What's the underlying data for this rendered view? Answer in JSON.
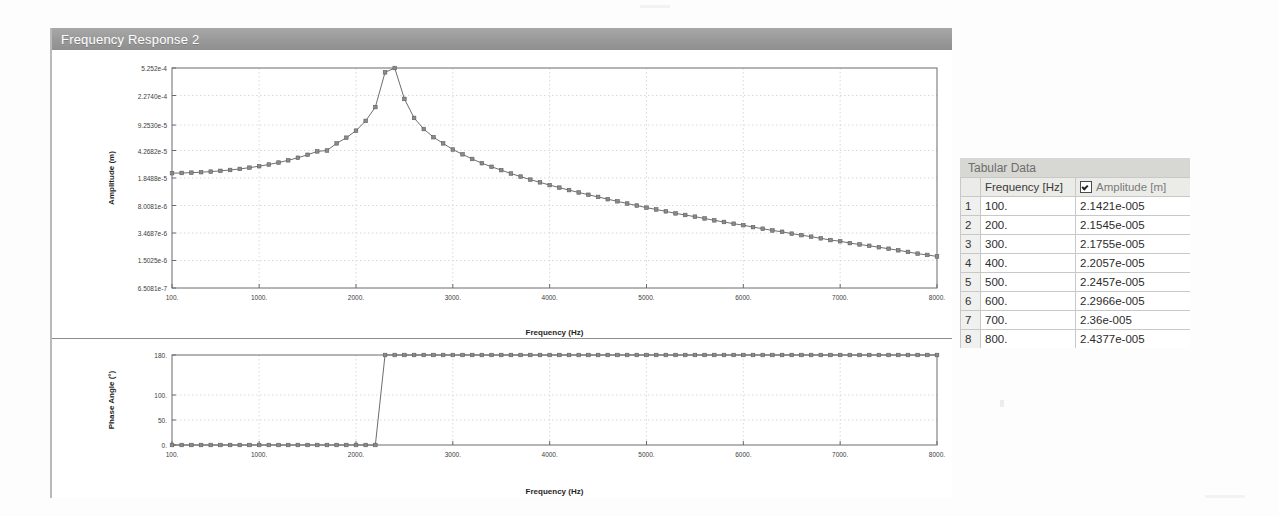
{
  "window": {
    "title": "Frequency Response 2"
  },
  "amplitude_plot": {
    "ylabel": "Amplitude (m)",
    "xlabel": "Frequency (Hz)",
    "ytick_labels": [
      "5.252e-4",
      "2.2740e-4",
      "9.2530e-5",
      "4.2682e-5",
      "1.8488e-5",
      "8.0081e-6",
      "3.4687e-6",
      "1.5025e-6",
      "6.5081e-7"
    ],
    "xtick_labels": [
      "100.",
      "1000.",
      "2000.",
      "3000.",
      "4000.",
      "5000.",
      "6000.",
      "7000.",
      "8000."
    ],
    "marker": "square",
    "line_color": "#6e6e6e",
    "grid": true
  },
  "phase_plot": {
    "ylabel": "Phase Angle (°)",
    "xlabel": "Frequency (Hz)",
    "ytick_labels": [
      "180.",
      "100.",
      "50.",
      "0."
    ],
    "xtick_labels": [
      "100.",
      "1000.",
      "2000.",
      "3000.",
      "4000.",
      "5000.",
      "6000.",
      "7000.",
      "8000."
    ],
    "marker": "square",
    "line_color": "#6e6e6e",
    "grid": true
  },
  "tabular_data": {
    "panel_title": "Tabular Data",
    "columns": [
      "",
      "Frequency [Hz]",
      "Amplitude [m]"
    ],
    "amplitude_checked": true,
    "rows": [
      {
        "n": "1",
        "frequency": "100.",
        "amplitude": "2.1421e-005"
      },
      {
        "n": "2",
        "frequency": "200.",
        "amplitude": "2.1545e-005"
      },
      {
        "n": "3",
        "frequency": "300.",
        "amplitude": "2.1755e-005"
      },
      {
        "n": "4",
        "frequency": "400.",
        "amplitude": "2.2057e-005"
      },
      {
        "n": "5",
        "frequency": "500.",
        "amplitude": "2.2457e-005"
      },
      {
        "n": "6",
        "frequency": "600.",
        "amplitude": "2.2966e-005"
      },
      {
        "n": "7",
        "frequency": "700.",
        "amplitude": "2.36e-005"
      },
      {
        "n": "8",
        "frequency": "800.",
        "amplitude": "2.4377e-005"
      }
    ]
  },
  "chart_data": [
    {
      "type": "line",
      "title": "Frequency Response 2 — Amplitude",
      "xlabel": "Frequency (Hz)",
      "ylabel": "Amplitude (m)",
      "yscale": "log",
      "xlim": [
        100,
        8000
      ],
      "ylim": [
        6.5081e-07,
        0.0005252
      ],
      "ytick_values": [
        0.0005252,
        0.0002274,
        9.253e-05,
        4.2682e-05,
        1.8488e-05,
        8.0081e-06,
        3.4687e-06,
        1.5025e-06,
        6.5081e-07
      ],
      "ytick_labels": [
        "5.252e-4",
        "2.2740e-4",
        "9.2530e-5",
        "4.2682e-5",
        "1.8488e-5",
        "8.0081e-6",
        "3.4687e-6",
        "1.5025e-6",
        "6.5081e-7"
      ],
      "xtick_values": [
        100,
        1000,
        2000,
        3000,
        4000,
        5000,
        6000,
        7000,
        8000
      ],
      "xtick_labels": [
        "100.",
        "1000.",
        "2000.",
        "3000.",
        "4000.",
        "5000.",
        "6000.",
        "7000.",
        "8000."
      ],
      "grid": true,
      "legend": "none",
      "series": [
        {
          "name": "Amplitude",
          "x": [
            100,
            200,
            300,
            400,
            500,
            600,
            700,
            800,
            900,
            1000,
            1100,
            1200,
            1300,
            1400,
            1500,
            1600,
            1700,
            1800,
            1900,
            2000,
            2100,
            2200,
            2300,
            2400,
            2500,
            2600,
            2700,
            2800,
            2900,
            3000,
            3100,
            3200,
            3300,
            3400,
            3500,
            3600,
            3700,
            3800,
            3900,
            4000,
            4100,
            4200,
            4300,
            4400,
            4500,
            4600,
            4700,
            4800,
            4900,
            5000,
            5100,
            5200,
            5300,
            5400,
            5500,
            5600,
            5700,
            5800,
            5900,
            6000,
            6100,
            6200,
            6300,
            6400,
            6500,
            6600,
            6700,
            6800,
            6900,
            7000,
            7100,
            7200,
            7300,
            7400,
            7500,
            7600,
            7700,
            7800,
            7900,
            8000
          ],
          "y": [
            2.1421e-05,
            2.1545e-05,
            2.1755e-05,
            2.2057e-05,
            2.2457e-05,
            2.2966e-05,
            2.36e-05,
            2.4377e-05,
            2.5324e-05,
            2.6474e-05,
            2.7871e-05,
            2.9573e-05,
            3.1659e-05,
            3.4238e-05,
            3.7463e-05,
            4.156e-05,
            4.2682e-05,
            5.3e-05,
            6.3e-05,
            7.8e-05,
            0.000105,
            0.00016,
            0.00046,
            0.0005252,
            0.000205,
            0.000115,
            8.2e-05,
            6.4e-05,
            5.3e-05,
            4.4e-05,
            3.8e-05,
            3.3e-05,
            2.9e-05,
            2.6e-05,
            2.35e-05,
            2.12e-05,
            1.93e-05,
            1.76e-05,
            1.62e-05,
            1.49e-05,
            1.38e-05,
            1.28e-05,
            1.19e-05,
            1.11e-05,
            1.04e-05,
            9.7e-06,
            9.1e-06,
            8.5e-06,
            8e-06,
            7.5e-06,
            7.1e-06,
            6.7e-06,
            6.3e-06,
            6e-06,
            5.7e-06,
            5.4e-06,
            5.1e-06,
            4.85e-06,
            4.6e-06,
            4.4e-06,
            4.15e-06,
            3.95e-06,
            3.75e-06,
            3.6e-06,
            3.4e-06,
            3.25e-06,
            3.1e-06,
            2.95e-06,
            2.8e-06,
            2.7e-06,
            2.55e-06,
            2.45e-06,
            2.35e-06,
            2.25e-06,
            2.15e-06,
            2.05e-06,
            1.95e-06,
            1.85e-06,
            1.78e-06,
            1.7e-06
          ]
        }
      ]
    },
    {
      "type": "line",
      "title": "Frequency Response 2 — Phase",
      "xlabel": "Frequency (Hz)",
      "ylabel": "Phase Angle (°)",
      "yscale": "linear",
      "xlim": [
        100,
        8000
      ],
      "ylim": [
        0,
        180
      ],
      "ytick_values": [
        0,
        50,
        100,
        180
      ],
      "ytick_labels": [
        "0.",
        "50.",
        "100.",
        "180."
      ],
      "xtick_values": [
        100,
        1000,
        2000,
        3000,
        4000,
        5000,
        6000,
        7000,
        8000
      ],
      "xtick_labels": [
        "100.",
        "1000.",
        "2000.",
        "3000.",
        "4000.",
        "5000.",
        "6000.",
        "7000.",
        "8000."
      ],
      "grid": true,
      "legend": "none",
      "series": [
        {
          "name": "Phase Angle",
          "x": [
            100,
            200,
            300,
            400,
            500,
            600,
            700,
            800,
            900,
            1000,
            1100,
            1200,
            1300,
            1400,
            1500,
            1600,
            1700,
            1800,
            1900,
            2000,
            2100,
            2200,
            2300,
            2400,
            2500,
            2600,
            2700,
            2800,
            2900,
            3000,
            3100,
            3200,
            3300,
            3400,
            3500,
            3600,
            3700,
            3800,
            3900,
            4000,
            4100,
            4200,
            4300,
            4400,
            4500,
            4600,
            4700,
            4800,
            4900,
            5000,
            5100,
            5200,
            5300,
            5400,
            5500,
            5600,
            5700,
            5800,
            5900,
            6000,
            6100,
            6200,
            6300,
            6400,
            6500,
            6600,
            6700,
            6800,
            6900,
            7000,
            7100,
            7200,
            7300,
            7400,
            7500,
            7600,
            7700,
            7800,
            7900,
            8000
          ],
          "y": [
            0,
            0,
            0,
            0,
            0,
            0,
            0,
            0,
            0,
            0,
            0,
            0,
            0,
            0,
            0,
            0,
            0,
            0,
            0,
            0,
            0,
            0,
            180,
            180,
            180,
            180,
            180,
            180,
            180,
            180,
            180,
            180,
            180,
            180,
            180,
            180,
            180,
            180,
            180,
            180,
            180,
            180,
            180,
            180,
            180,
            180,
            180,
            180,
            180,
            180,
            180,
            180,
            180,
            180,
            180,
            180,
            180,
            180,
            180,
            180,
            180,
            180,
            180,
            180,
            180,
            180,
            180,
            180,
            180,
            180,
            180,
            180,
            180,
            180,
            180,
            180,
            180,
            180,
            180,
            180
          ]
        }
      ]
    }
  ]
}
